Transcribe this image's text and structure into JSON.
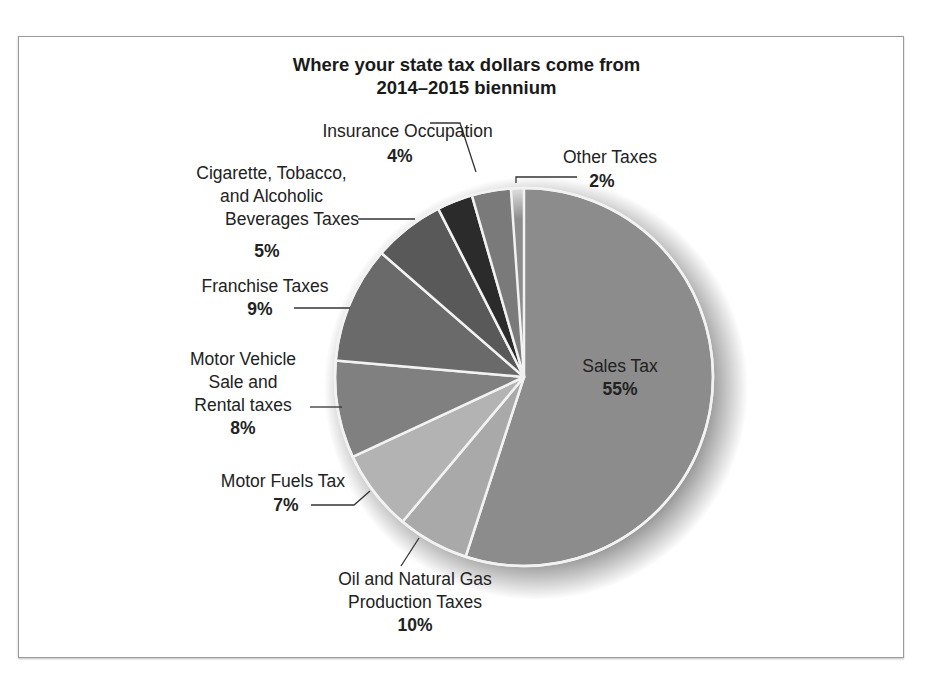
{
  "chart_data": {
    "type": "pie",
    "title": "Where your state tax dollars come from",
    "subtitle": "2014–2015 biennium",
    "labels_as_printed": true,
    "note": "Values are the percentages printed on the chart labels. Drawn wedge sizes are estimated from the image and do not match every printed label (e.g. Insurance Occupation looks ~3%, Cigarette/Tobacco ~6%).",
    "categories": [
      "Sales Tax",
      "Oil and Natural Gas Production Taxes",
      "Motor Fuels Tax",
      "Motor Vehicle Sale and Rental taxes",
      "Franchise Taxes",
      "Cigarette, Tobacco, and Alcoholic Beverages Taxes",
      "Insurance Occupation",
      "Other Taxes"
    ],
    "values": [
      55,
      10,
      7,
      8,
      9,
      5,
      4,
      2
    ],
    "unit": "%",
    "order": "clockwise from 12 o'clock",
    "drawn_degrees_estimate": [
      198,
      22,
      25,
      30,
      36,
      22,
      11,
      12
    ],
    "legend": "none (direct labels with leader lines)"
  },
  "title": {
    "line1": "Where your state tax dollars come from",
    "line2": "2014–2015 biennium"
  },
  "labels": {
    "sales": {
      "name": "Sales Tax",
      "pct": "55%"
    },
    "oil": {
      "name1": "Oil and Natural Gas",
      "name2": "Production Taxes",
      "pct": "10%"
    },
    "fuels": {
      "name": "Motor Fuels Tax",
      "pct": "7%"
    },
    "vehicle": {
      "name1": "Motor Vehicle",
      "name2": "Sale and",
      "name3": "Rental taxes",
      "pct": "8%"
    },
    "franchise": {
      "name": "Franchise Taxes",
      "pct": "9%"
    },
    "cigarette": {
      "name1": "Cigarette, Tobacco,",
      "name2": "and Alcoholic",
      "name3": "Beverages Taxes",
      "pct": "5%"
    },
    "insurance": {
      "name": "Insurance Occupation",
      "pct": "4%"
    },
    "other": {
      "name": "Other Taxes",
      "pct": "2%"
    }
  },
  "colors": {
    "sales": "#8c8c8c",
    "oil": "#a9a9a9",
    "fuels": "#b3b3b3",
    "vehicle": "#808080",
    "franchise": "#6a6a6a",
    "cigarette": "#595959",
    "insurance": "#2b2b2b",
    "other": "#7a7a7a",
    "separator": "#f2f2f2"
  }
}
